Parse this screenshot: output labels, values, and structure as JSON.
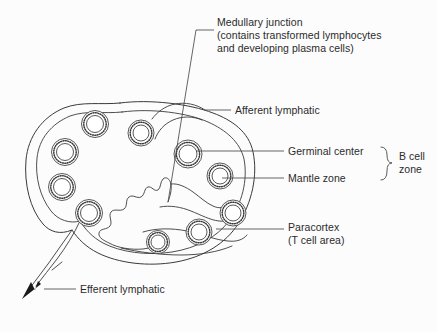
{
  "figure": {
    "width": 437,
    "height": 332,
    "background_color": "#fcfcfc",
    "ink_color": "#3a3a3a",
    "text_color": "#2b2b2b"
  },
  "labels": {
    "medullary_junction": "Medullary junction\n(contains transformed lymphocytes\nand developing plasma cells)",
    "afferent_lymphatic": "Afferent lymphatic",
    "germinal_center": "Germinal center",
    "mantle_zone": "Mantle zone",
    "b_cell_zone": "B cell\nzone",
    "paracortex": "Paracortex\n(T cell area)",
    "efferent_lymphatic": "Efferent lymphatic"
  },
  "structures": {
    "capsule_name": "lymph-node-capsule",
    "subcapsular_sinus_name": "subcapsular-sinus",
    "medulla_name": "medulla-medullary-cords",
    "afferent_vessel_name": "afferent-lymphatic-vessel",
    "efferent_vessel_name": "efferent-lymphatic-vessel"
  },
  "follicles": [
    {
      "id": "follicle-1",
      "cx": 95,
      "cy": 124,
      "r_mantle": 13.5,
      "r_germinal": 8.5
    },
    {
      "id": "follicle-2",
      "cx": 65,
      "cy": 152,
      "r_mantle": 13.5,
      "r_germinal": 8.5
    },
    {
      "id": "follicle-3",
      "cx": 62,
      "cy": 187,
      "r_mantle": 13.5,
      "r_germinal": 8.5
    },
    {
      "id": "follicle-4",
      "cx": 89,
      "cy": 213,
      "r_mantle": 13.5,
      "r_germinal": 8.5
    },
    {
      "id": "follicle-5",
      "cx": 141,
      "cy": 133,
      "r_mantle": 13.0,
      "r_germinal": 8.0
    },
    {
      "id": "follicle-6",
      "cx": 188,
      "cy": 154,
      "r_mantle": 14.0,
      "r_germinal": 9.0
    },
    {
      "id": "follicle-7",
      "cx": 220,
      "cy": 176,
      "r_mantle": 13.0,
      "r_germinal": 8.0
    },
    {
      "id": "follicle-8",
      "cx": 233,
      "cy": 213,
      "r_mantle": 13.0,
      "r_germinal": 8.0
    },
    {
      "id": "follicle-9",
      "cx": 199,
      "cy": 232,
      "r_mantle": 13.0,
      "r_germinal": 8.0
    },
    {
      "id": "follicle-10",
      "cx": 158,
      "cy": 242,
      "r_mantle": 11.5,
      "r_germinal": 7.0
    }
  ],
  "leaders": {
    "medullary_junction": "M 214 30 L 196 30 M 196 30 L 168 202",
    "afferent_lymphatic": "M 231 110 L 205 110",
    "germinal_center": "M 284 151 L 196 151",
    "mantle_zone": "M 284 178 L 222 178",
    "paracortex": "M 284 229 L 216 229",
    "efferent_lymphatic": "M 76 289 L 44 289"
  },
  "brace": {
    "name": "b-cell-zone-brace",
    "path": "M 381 147 Q 387 147 387 155 Q 387 163 392 163 Q 387 163 387 171 Q 387 180 381 180"
  }
}
